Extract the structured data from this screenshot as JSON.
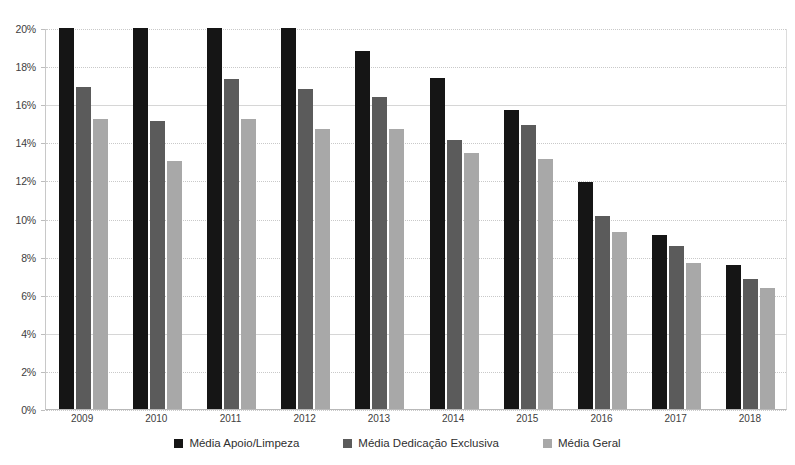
{
  "chart_data": {
    "type": "bar",
    "title": "",
    "subtitle": "",
    "xlabel": "",
    "ylabel": "",
    "categories": [
      "2009",
      "2010",
      "2011",
      "2012",
      "2013",
      "2014",
      "2015",
      "2016",
      "2017",
      "2018"
    ],
    "series": [
      {
        "name": "Média Apoio/Limpeza",
        "color": "#151515",
        "values": [
          20.0,
          20.0,
          20.0,
          20.0,
          18.8,
          17.4,
          15.7,
          11.9,
          9.15,
          7.55
        ]
      },
      {
        "name": "Média Dedicação Exclusiva",
        "color": "#5b5b5b",
        "values": [
          16.9,
          15.1,
          17.3,
          16.8,
          16.4,
          14.1,
          14.9,
          10.15,
          8.55,
          6.85
        ]
      },
      {
        "name": "Média Geral",
        "color": "#a8a8a8",
        "values": [
          15.25,
          13.0,
          15.25,
          14.7,
          14.7,
          13.45,
          13.1,
          9.3,
          7.65,
          6.35
        ]
      }
    ],
    "ylim": [
      0,
      20
    ],
    "y_ticks": [
      "0%",
      "2%",
      "4%",
      "6%",
      "8%",
      "10%",
      "12%",
      "14%",
      "16%",
      "18%",
      "20%"
    ],
    "y_tick_values": [
      0,
      2,
      4,
      6,
      8,
      10,
      12,
      14,
      16,
      18,
      20
    ],
    "grid": true,
    "legend_position": "bottom",
    "value_unit": "%",
    "note_clipped_at_top": "Black bars for 2009-2012 are clipped at the 20% axis maximum"
  },
  "legend": {
    "items": [
      {
        "label": "Média Apoio/Limpeza",
        "color": "#151515"
      },
      {
        "label": "Média Dedicação Exclusiva",
        "color": "#5b5b5b"
      },
      {
        "label": "Média Geral",
        "color": "#a8a8a8"
      }
    ]
  }
}
